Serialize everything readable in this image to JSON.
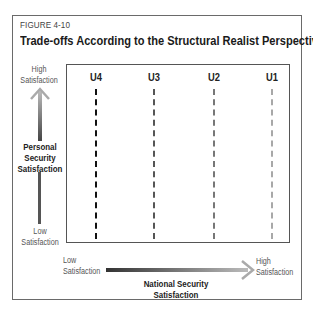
{
  "figure": {
    "label": "FIGURE 4-10",
    "title": "Trade-offs According to the Structural Realist Perspective"
  },
  "y_axis": {
    "top_label_line1": "High",
    "top_label_line2": "Satisfaction",
    "title_line1": "Personal",
    "title_line2": "Security",
    "title_line3": "Satisfaction",
    "bottom_label_line1": "Low",
    "bottom_label_line2": "Satisfaction"
  },
  "x_axis": {
    "left_label_line1": "Low",
    "left_label_line2": "Satisfaction",
    "right_label_line1": "High",
    "right_label_line2": "Satisfaction",
    "title_line1": "National Security",
    "title_line2": "Satisfaction"
  },
  "curves": [
    {
      "label": "U4",
      "color": "#111111"
    },
    {
      "label": "U3",
      "color": "#555555"
    },
    {
      "label": "U2",
      "color": "#777777"
    },
    {
      "label": "U1",
      "color": "#a8a8a8"
    }
  ]
}
